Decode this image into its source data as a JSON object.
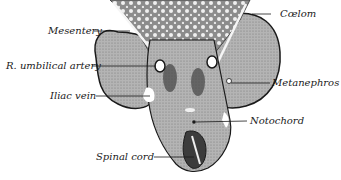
{
  "figure": {
    "type": "anatomical cross-section illustration",
    "labels": [
      {
        "id": "mesentery",
        "text": "Mesentery"
      },
      {
        "id": "coelom",
        "text": "Cœlom"
      },
      {
        "id": "r-umbilical-artery",
        "text": "R. umbilical artery"
      },
      {
        "id": "metanephros",
        "text": "Metanephros"
      },
      {
        "id": "iliac-vein",
        "text": "Iliac vein"
      },
      {
        "id": "notochord",
        "text": "Notochord"
      },
      {
        "id": "spinal-cord",
        "text": "Spinal cord"
      }
    ],
    "colors": {
      "tissue": "#a8a8a8",
      "tissue_dark": "#5a5a5a",
      "outline": "#1a1a1a",
      "background": "#ffffff"
    }
  }
}
